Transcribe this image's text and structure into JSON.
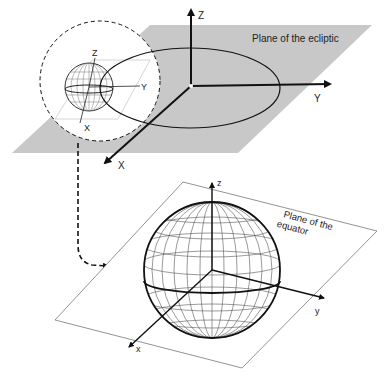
{
  "top_diagram": {
    "plane_label": "Plane of the ecliptic",
    "axes": {
      "z": "Z",
      "y": "Y",
      "x": "X"
    },
    "inset_axes": {
      "z": "Z",
      "y": "Y",
      "x": "X"
    },
    "plane_color": "#c8c8c8"
  },
  "bottom_diagram": {
    "plane_label_line1": "Plane of the",
    "plane_label_line2": "equator",
    "axes": {
      "z": "z",
      "y": "y",
      "x": "x"
    }
  }
}
